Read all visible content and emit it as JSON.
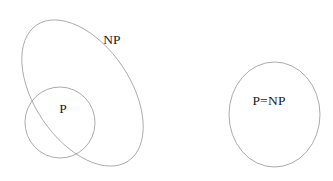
{
  "figure": {
    "kind": "venn-diagram",
    "background_color": "#ffffff",
    "stroke_color": "#9c9c9c",
    "text_color": "#1c1c1c",
    "panels": [
      {
        "name": "p-subset-np-panel",
        "shapes": [
          {
            "name": "np-ellipse",
            "label": "NP",
            "cx": 82.5,
            "cy": 93,
            "rx": 48,
            "ry": 82,
            "rotate": -34,
            "label_x": 112,
            "label_y": 41
          },
          {
            "name": "p-ellipse",
            "label": "P",
            "cx": 60,
            "cy": 122.5,
            "rx": 35,
            "ry": 35.5,
            "rotate": -10,
            "label_x": 63,
            "label_y": 110
          }
        ]
      },
      {
        "name": "p-equals-np-panel",
        "shapes": [
          {
            "name": "p-equals-np-ellipse",
            "label": "P=NP",
            "cx": 274.5,
            "cy": 114.5,
            "rx": 45.5,
            "ry": 52.5,
            "rotate": 0,
            "label_x": 269,
            "label_y": 102
          }
        ]
      }
    ]
  }
}
